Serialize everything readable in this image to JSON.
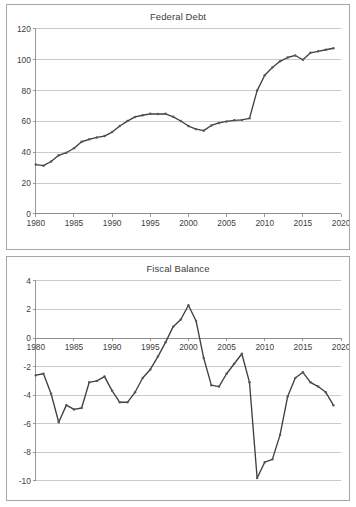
{
  "page": {
    "background_color": "#ffffff",
    "panel_border_color": "#a6a6a6"
  },
  "style": {
    "line_color": "#3f3f3f",
    "marker_color": "#595959",
    "gridline_color": "#b3b3b3",
    "axis_color": "#7f7f7f",
    "text_color": "#404040"
  },
  "charts": {
    "federal_debt": {
      "title": "Federal Debt",
      "y_tick_labels": [
        "120",
        "100",
        "80",
        "60",
        "40",
        "20",
        "0"
      ],
      "x_tick_labels": [
        "1980",
        "1985",
        "1990",
        "1995",
        "2000",
        "2005",
        "2010",
        "2015",
        "2020"
      ]
    },
    "fiscal_balance": {
      "title": "Fiscal Balance",
      "y_tick_labels": [
        "4",
        "2",
        "0",
        "-2",
        "-4",
        "-6",
        "-8",
        "-10"
      ],
      "x_tick_labels": [
        "1980",
        "1985",
        "1990",
        "1995",
        "2000",
        "2005",
        "2010",
        "2015",
        "2020"
      ]
    }
  },
  "chart_data": [
    {
      "type": "line",
      "title": "Federal Debt",
      "xlabel": "",
      "ylabel": "",
      "xlim": [
        1980,
        2020
      ],
      "ylim": [
        0,
        120
      ],
      "ytick_step": 20,
      "xtick_step": 5,
      "grid": true,
      "legend": false,
      "markers": true,
      "x": [
        1980,
        1981,
        1982,
        1983,
        1984,
        1985,
        1986,
        1987,
        1988,
        1989,
        1990,
        1991,
        1992,
        1993,
        1994,
        1995,
        1996,
        1997,
        1998,
        1999,
        2000,
        2001,
        2002,
        2003,
        2004,
        2005,
        2006,
        2007,
        2008,
        2009,
        2010,
        2011,
        2012,
        2013,
        2014,
        2015,
        2016,
        2017,
        2018,
        2019
      ],
      "values": [
        32.0,
        31.3,
        34.0,
        38.0,
        39.7,
        42.6,
        46.8,
        48.4,
        49.6,
        50.5,
        53.1,
        57.0,
        60.2,
        62.9,
        64.0,
        64.9,
        64.8,
        64.9,
        63.0,
        60.3,
        57.0,
        55.0,
        54.0,
        57.4,
        59.0,
        60.0,
        60.7,
        61.0,
        62.0,
        80.0,
        90.0,
        95.0,
        99.0,
        101.5,
        102.8,
        100.0,
        104.5,
        105.5,
        106.5,
        107.5
      ]
    },
    {
      "type": "line",
      "title": "Fiscal Balance",
      "xlabel": "",
      "ylabel": "",
      "xlim": [
        1980,
        2020
      ],
      "ylim": [
        -10,
        4
      ],
      "ytick_step": 2,
      "xtick_step": 5,
      "grid": true,
      "legend": false,
      "markers": true,
      "x": [
        1980,
        1981,
        1982,
        1983,
        1984,
        1985,
        1986,
        1987,
        1988,
        1989,
        1990,
        1991,
        1992,
        1993,
        1994,
        1995,
        1996,
        1997,
        1998,
        1999,
        2000,
        2001,
        2002,
        2003,
        2004,
        2005,
        2006,
        2007,
        2008,
        2009,
        2010,
        2011,
        2012,
        2013,
        2014,
        2015,
        2016,
        2017,
        2018,
        2019
      ],
      "values": [
        -2.6,
        -2.5,
        -3.9,
        -5.9,
        -4.7,
        -5.0,
        -4.9,
        -3.1,
        -3.0,
        -2.7,
        -3.7,
        -4.5,
        -4.5,
        -3.8,
        -2.8,
        -2.2,
        -1.3,
        -0.3,
        0.8,
        1.3,
        2.3,
        1.2,
        -1.4,
        -3.3,
        -3.4,
        -2.5,
        -1.8,
        -1.1,
        -3.1,
        -9.8,
        -8.7,
        -8.5,
        -6.8,
        -4.1,
        -2.8,
        -2.4,
        -3.1,
        -3.4,
        -3.8,
        -4.7
      ]
    }
  ]
}
